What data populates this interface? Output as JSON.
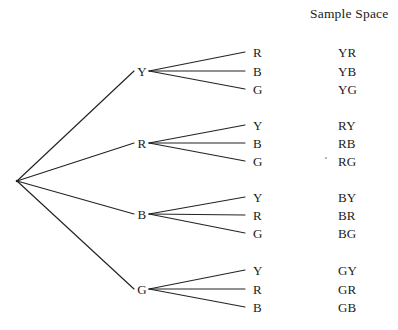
{
  "title": "Sample Space",
  "diagram": {
    "type": "probability-tree",
    "root": {
      "label": "",
      "x": 17,
      "y": 181
    },
    "branches": [
      {
        "label": "Y",
        "x": 142,
        "y": 71,
        "leaves": [
          {
            "label": "R",
            "x": 253,
            "y": 52,
            "outcome": "YR"
          },
          {
            "label": "B",
            "x": 253,
            "y": 71,
            "outcome": "YB"
          },
          {
            "label": "G",
            "x": 253,
            "y": 89,
            "outcome": "YG"
          }
        ]
      },
      {
        "label": "R",
        "x": 142,
        "y": 143,
        "leaves": [
          {
            "label": "Y",
            "x": 253,
            "y": 125,
            "outcome": "RY"
          },
          {
            "label": "B",
            "x": 253,
            "y": 143,
            "outcome": "RB"
          },
          {
            "label": "G",
            "x": 253,
            "y": 161,
            "outcome": "RG"
          }
        ]
      },
      {
        "label": "B",
        "x": 142,
        "y": 214,
        "leaves": [
          {
            "label": "Y",
            "x": 253,
            "y": 197,
            "outcome": "BY"
          },
          {
            "label": "R",
            "x": 253,
            "y": 215,
            "outcome": "BR"
          },
          {
            "label": "G",
            "x": 253,
            "y": 233,
            "outcome": "BG"
          }
        ]
      },
      {
        "label": "G",
        "x": 142,
        "y": 289,
        "leaves": [
          {
            "label": "Y",
            "x": 253,
            "y": 270,
            "outcome": "GY"
          },
          {
            "label": "R",
            "x": 253,
            "y": 289,
            "outcome": "GR"
          },
          {
            "label": "B",
            "x": 253,
            "y": 307,
            "outcome": "GB"
          }
        ]
      }
    ],
    "outcome_column_x": 338,
    "colors": {
      "background": "#ffffff",
      "ink": "#1b1b1b",
      "line": "#232323"
    }
  }
}
